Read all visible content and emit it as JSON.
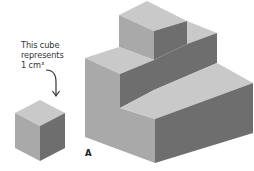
{
  "caption": {
    "line1": "This cube",
    "line2": "represents",
    "line3": "1 cm³"
  },
  "figure_label": "A",
  "colors": {
    "top_face": "#c9c9c9",
    "left_face": "#a9a9a9",
    "right_face": "#6e6e6e",
    "arrow": "#333333"
  }
}
